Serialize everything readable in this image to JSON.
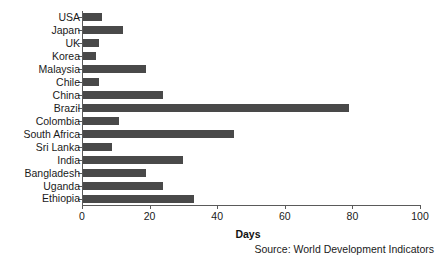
{
  "chart_data": {
    "type": "bar",
    "orientation": "horizontal",
    "title": "",
    "xlabel": "Days",
    "ylabel": "",
    "xlim": [
      0,
      100
    ],
    "xticks": [
      0,
      20,
      40,
      60,
      80,
      100
    ],
    "grid": false,
    "legend": null,
    "bar_color": "#494949",
    "axis_color": "#5a5a5a",
    "categories": [
      "USA",
      "Japan",
      "UK",
      "Korea",
      "Malaysia",
      "Chile",
      "China",
      "Brazil",
      "Colombia",
      "South Africa",
      "Sri Lanka",
      "India",
      "Bangladesh",
      "Uganda",
      "Ethiopia"
    ],
    "values": [
      6,
      12,
      5,
      4,
      19,
      5,
      24,
      79,
      11,
      45,
      9,
      30,
      19,
      24,
      33
    ],
    "annotations": [
      "Source: World Development Indicators"
    ]
  },
  "footer": {
    "source": "Source: World Development Indicators"
  }
}
